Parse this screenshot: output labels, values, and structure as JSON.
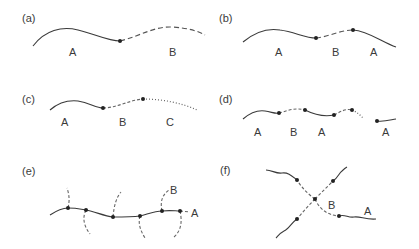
{
  "figure": {
    "panels": [
      {
        "id": "a",
        "label": "(a)",
        "segments": [
          "A",
          "B"
        ],
        "architecture": "diblock"
      },
      {
        "id": "b",
        "label": "(b)",
        "segments": [
          "A",
          "B",
          "A"
        ],
        "architecture": "triblock ABA"
      },
      {
        "id": "c",
        "label": "(c)",
        "segments": [
          "A",
          "B",
          "C"
        ],
        "architecture": "triblock ABC"
      },
      {
        "id": "d",
        "label": "(d)",
        "segments": [
          "A",
          "B",
          "A",
          "A"
        ],
        "architecture": "multiblock"
      },
      {
        "id": "e",
        "label": "(e)",
        "segments": [
          "B",
          "A"
        ],
        "architecture": "graft"
      },
      {
        "id": "f",
        "label": "(f)",
        "segments": [
          "B",
          "A"
        ],
        "architecture": "star block"
      }
    ]
  },
  "legend_styles": {
    "A": "solid line",
    "B": "dashed line",
    "C": "dotted line"
  },
  "colors": {
    "line": "#3a3a3a",
    "junction": "#222222",
    "background": "#ffffff"
  }
}
